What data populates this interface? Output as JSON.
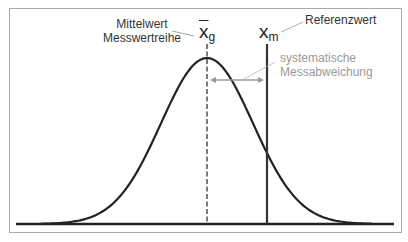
{
  "labels": {
    "mean_line1": "Mittelwert",
    "mean_line2": "Messwertreihe",
    "mean_symbol": "x",
    "mean_subscript": "g",
    "reference_symbol": "x",
    "reference_subscript": "m",
    "reference_label": "Referenzwert",
    "bias_line1": "systematische",
    "bias_line2": "Messabweichung"
  },
  "colors": {
    "frame": "#aaaaaa",
    "curve": "#222222",
    "baseline": "#222222",
    "mean_line": "#222222",
    "reference_line": "#333333",
    "arrow": "#9a9a9a",
    "leader_dark": "#777777",
    "leader_gray": "#b0b0b0",
    "text_dark": "#333333",
    "text_gray": "#9a9a9a"
  },
  "geometry": {
    "mean_x": 207,
    "reference_x": 267,
    "baseline_y": 224,
    "peak_y": 58,
    "arrow_y": 80
  }
}
